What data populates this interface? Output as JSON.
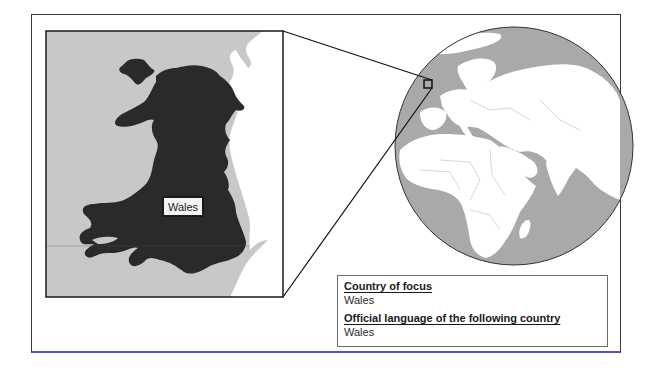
{
  "inset_map": {
    "label": "Wales",
    "colors": {
      "sea": "#c8c8c8",
      "wales": "#2a2a2c",
      "england": "#ffffff"
    }
  },
  "globe": {
    "colors": {
      "ocean": "#a9a9a9",
      "land": "#ffffff",
      "outline": "#333333"
    },
    "locator": "wales-locator-square"
  },
  "info_box": {
    "sections": [
      {
        "heading": "Country of focus",
        "value": "Wales"
      },
      {
        "heading": "Official language of the following country",
        "value": "Wales"
      }
    ]
  },
  "colors": {
    "frame_border": "#3a3a3a",
    "frame_bottom_border": "#4a55c8"
  }
}
